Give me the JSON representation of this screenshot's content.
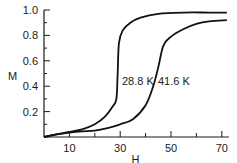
{
  "chart_data": {
    "type": "line",
    "title": "",
    "xlabel": "H",
    "ylabel": "M",
    "xlim": [
      0,
      72
    ],
    "ylim": [
      0,
      1.0
    ],
    "grid": false,
    "x_ticks": [
      10,
      30,
      50,
      70
    ],
    "x_minor_ticks": [
      20,
      40,
      60
    ],
    "y_ticks": [
      0.2,
      0.4,
      0.6,
      0.8,
      1.0
    ],
    "y_tick_labels": [
      "0.2",
      "0.4",
      "0.6",
      "0.8",
      "1.0"
    ],
    "x_tick_labels": [
      "10",
      "30",
      "50",
      "70"
    ],
    "series": [
      {
        "name": "28.8 K",
        "x": [
          0,
          5,
          10,
          15,
          20,
          24,
          27,
          28.5,
          29,
          29.5,
          31,
          34,
          38,
          45,
          55,
          65,
          72
        ],
        "y": [
          0,
          0.02,
          0.04,
          0.06,
          0.1,
          0.16,
          0.24,
          0.3,
          0.5,
          0.74,
          0.84,
          0.9,
          0.94,
          0.97,
          0.98,
          0.98,
          0.98
        ]
      },
      {
        "name": "41.6 K",
        "x": [
          0,
          5,
          10,
          15,
          20,
          25,
          30,
          35,
          40,
          43,
          45,
          47,
          50,
          55,
          60,
          65,
          72
        ],
        "y": [
          0,
          0.02,
          0.035,
          0.045,
          0.05,
          0.07,
          0.1,
          0.14,
          0.25,
          0.4,
          0.55,
          0.72,
          0.79,
          0.85,
          0.89,
          0.91,
          0.92
        ]
      }
    ],
    "annotations": [
      {
        "text": "28.8 K",
        "x": 30,
        "y": 0.45
      },
      {
        "text": "41.6 K",
        "x": 45,
        "y": 0.45
      }
    ]
  }
}
